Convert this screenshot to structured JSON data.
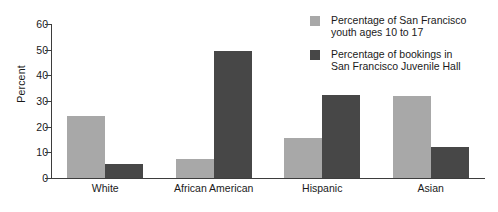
{
  "chart_data": {
    "type": "bar",
    "title": "",
    "xlabel": "",
    "ylabel": "Percent",
    "ylim": [
      0,
      60
    ],
    "yticks": [
      0,
      10,
      20,
      30,
      40,
      50,
      60
    ],
    "ytick_labels": [
      "0",
      "10",
      "20",
      "30",
      "40",
      "50",
      "60"
    ],
    "grid": false,
    "legend_position": "top-right",
    "categories": [
      "White",
      "African American",
      "Hispanic",
      "Asian"
    ],
    "series": [
      {
        "name": "Percentage of San Francisco youth ages 10 to 17",
        "name_lines": [
          "Percentage of San Francisco",
          "youth ages 10 to 17"
        ],
        "color": "#a8a8a8",
        "values": [
          24,
          7.5,
          15.5,
          32
        ]
      },
      {
        "name": "Percentage of bookings in San Francisco Juvenile Hall",
        "name_lines": [
          "Percentage of bookings in",
          "San Francisco Juvenile Hall"
        ],
        "color": "#474747",
        "values": [
          5.5,
          49.5,
          32.5,
          12
        ]
      }
    ]
  },
  "colors": {
    "series_light": "#a8a8a8",
    "series_dark": "#474747",
    "axis": "#3d3d3d",
    "text": "#1a1a1a",
    "background": "#ffffff"
  }
}
